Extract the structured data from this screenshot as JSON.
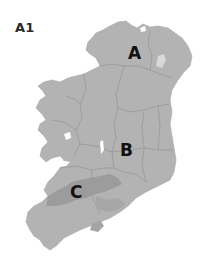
{
  "figure": {
    "label": "A1"
  },
  "map": {
    "subject": "island-of-ireland",
    "colors": {
      "land": "#b3b3b3",
      "border": "#8e8e8e",
      "highlight_dark": "#9c9c9c",
      "highlight_light": "#d9d9d9",
      "water": "#ffffff"
    },
    "markers": [
      {
        "id": "A",
        "label": "A",
        "x": 128,
        "y": 45
      },
      {
        "id": "B",
        "label": "B",
        "x": 122,
        "y": 142
      },
      {
        "id": "C",
        "label": "C",
        "x": 72,
        "y": 186
      }
    ]
  }
}
